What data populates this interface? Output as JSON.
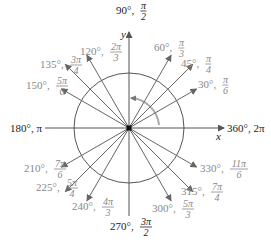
{
  "diagram": {
    "center": [
      129,
      128
    ],
    "radius": 55,
    "colors": {
      "axis": "#555555",
      "arrow": "#666666",
      "circle": "#555555",
      "label_dark": "#222222",
      "label_light": "#888888",
      "rotation_arc": "#aaaaaa"
    },
    "axes": {
      "x_label": "x",
      "y_label": "y"
    },
    "axis_labels": [
      {
        "id": "90",
        "deg": "90°,",
        "num": "π",
        "den": "2",
        "x": 116,
        "y": 14,
        "dark": true
      },
      {
        "id": "180",
        "deg": "180°, π",
        "num": "",
        "den": "",
        "x": 10,
        "y": 132,
        "dark": true
      },
      {
        "id": "360",
        "deg": "360°, 2π",
        "num": "",
        "den": "",
        "x": 227,
        "y": 132,
        "dark": true
      },
      {
        "id": "270",
        "deg": "270°,",
        "num": "3π",
        "den": "2",
        "x": 110,
        "y": 230,
        "dark": true
      }
    ],
    "angles": [
      {
        "id": "30",
        "deg": "30°,",
        "num": "π",
        "den": "6",
        "angle": 30,
        "len": 78,
        "lx": 198,
        "ly": 88
      },
      {
        "id": "45",
        "deg": "45°,",
        "num": "π",
        "den": "4",
        "angle": 45,
        "len": 90,
        "lx": 181,
        "ly": 67
      },
      {
        "id": "60",
        "deg": "60°,",
        "num": "π",
        "den": "3",
        "angle": 60,
        "len": 84,
        "lx": 154,
        "ly": 51
      },
      {
        "id": "120",
        "deg": "120°,",
        "num": "2π",
        "den": "3",
        "angle": 120,
        "len": 84,
        "lx": 80,
        "ly": 55
      },
      {
        "id": "135",
        "deg": "135°,",
        "num": "3π",
        "den": "4",
        "angle": 135,
        "len": 90,
        "lx": 40,
        "ly": 68
      },
      {
        "id": "150",
        "deg": "150°,",
        "num": "5π",
        "den": "6",
        "angle": 150,
        "len": 78,
        "lx": 26,
        "ly": 89
      },
      {
        "id": "210",
        "deg": "210°,",
        "num": "7π",
        "den": "6",
        "angle": 210,
        "len": 78,
        "lx": 24,
        "ly": 172
      },
      {
        "id": "225",
        "deg": "225°,",
        "num": "5π",
        "den": "4",
        "angle": 225,
        "len": 90,
        "lx": 36,
        "ly": 191
      },
      {
        "id": "240",
        "deg": "240°,",
        "num": "4π",
        "den": "3",
        "angle": 240,
        "len": 84,
        "lx": 72,
        "ly": 210
      },
      {
        "id": "300",
        "deg": "300°,",
        "num": "5π",
        "den": "3",
        "angle": 300,
        "len": 84,
        "lx": 152,
        "ly": 212
      },
      {
        "id": "315",
        "deg": "315°,",
        "num": "7π",
        "den": "4",
        "angle": 315,
        "len": 90,
        "lx": 181,
        "ly": 195
      },
      {
        "id": "330",
        "deg": "330°,",
        "num": "11π",
        "den": "6",
        "angle": 330,
        "len": 78,
        "lx": 200,
        "ly": 172
      }
    ]
  }
}
